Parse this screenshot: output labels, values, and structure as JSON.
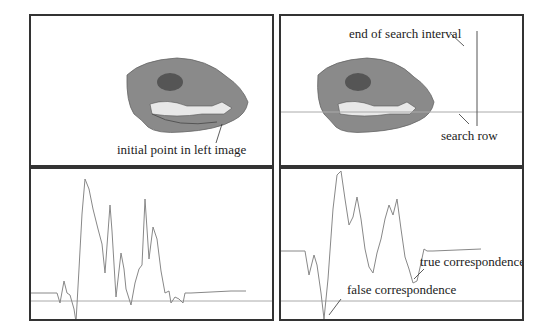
{
  "figure": {
    "panels": [
      {
        "id": "top-left",
        "description": "skull image, left view"
      },
      {
        "id": "top-right",
        "description": "skull image, right view with search row"
      },
      {
        "id": "bottom-left",
        "description": "intensity profile along row, left image"
      },
      {
        "id": "bottom-right",
        "description": "correlation profile along search row"
      }
    ],
    "labels": {
      "initial_point": "initial point in left image",
      "end_of_search": "end of search interval",
      "search_row": "search row",
      "true_corr": "true correspondence",
      "false_corr": "false correspondence"
    },
    "colors": {
      "border": "#333333",
      "curve": "#888888",
      "baseline": "#aaaaaa",
      "skull": "#8a8a8a"
    }
  }
}
